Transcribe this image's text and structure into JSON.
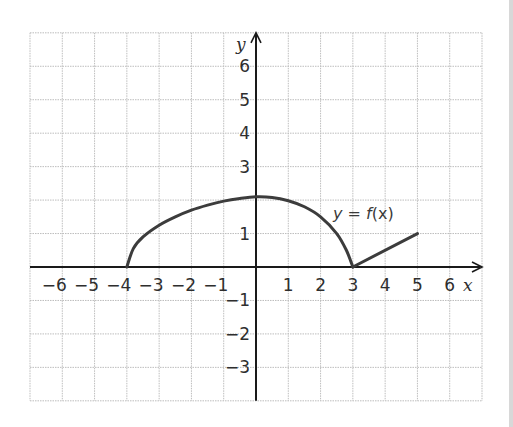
{
  "chart_data": {
    "type": "line",
    "title": "",
    "xlabel": "x",
    "ylabel": "y",
    "function_label": "y = f(x)",
    "xlim": [
      -7,
      7
    ],
    "ylim": [
      -4,
      7
    ],
    "grid": true,
    "x_ticks": [
      "−6",
      "−5",
      "−4",
      "−3",
      "−2",
      "−1",
      "1",
      "2",
      "3",
      "4",
      "5",
      "6"
    ],
    "y_ticks": [
      "6",
      "5",
      "4",
      "3",
      "1",
      "−1",
      "−2",
      "−3"
    ],
    "series": [
      {
        "name": "f(x)",
        "points": [
          [
            -4,
            0
          ],
          [
            -3.8,
            0.55
          ],
          [
            -3.5,
            0.9
          ],
          [
            -3,
            1.25
          ],
          [
            -2.5,
            1.5
          ],
          [
            -2,
            1.7
          ],
          [
            -1.5,
            1.85
          ],
          [
            -1,
            1.97
          ],
          [
            -0.5,
            2.05
          ],
          [
            0,
            2.1
          ],
          [
            0.5,
            2.08
          ],
          [
            1,
            1.98
          ],
          [
            1.5,
            1.8
          ],
          [
            2,
            1.5
          ],
          [
            2.5,
            1.0
          ],
          [
            2.8,
            0.5
          ],
          [
            3,
            0
          ]
        ]
      },
      {
        "name": "f(x) linear piece",
        "points": [
          [
            3,
            0
          ],
          [
            5,
            1
          ]
        ]
      }
    ],
    "key_points": {
      "start": [
        -4,
        0
      ],
      "peak": [
        0,
        2.1
      ],
      "cusp": [
        3,
        0
      ],
      "end": [
        5,
        1
      ]
    }
  },
  "labels": {
    "x_axis": "x",
    "y_axis": "y",
    "function": {
      "prefix": "y = ",
      "name": "f",
      "arg": "(x)"
    }
  },
  "colors": {
    "grid": "#bdbdbd",
    "axis": "#1a1a1a",
    "curve": "#3c3c3c",
    "text": "#2e2e2e"
  }
}
